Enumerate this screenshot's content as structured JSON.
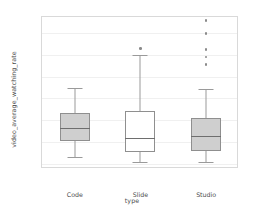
{
  "chart_data": {
    "type": "box",
    "title": "",
    "xlabel": "type",
    "ylabel": "video_average_watching_rate",
    "categories": [
      "Code",
      "Slide",
      "Studio"
    ],
    "ylim": [
      -0.025,
      0.675
    ],
    "yticks": [
      0.0,
      0.1,
      0.2,
      0.3,
      0.4,
      0.5,
      0.6
    ],
    "ytick_labels": [
      "0.0",
      "0.1",
      "0.2",
      "0.3",
      "0.4",
      "0.5",
      "0.6"
    ],
    "grid": "horizontal",
    "legend": "none",
    "boxes": [
      {
        "label": "Code",
        "fill": "#cfcfcf",
        "whisker_low": 0.03,
        "q1": 0.105,
        "median": 0.165,
        "q3": 0.235,
        "whisker_high": 0.35,
        "outliers": []
      },
      {
        "label": "Slide",
        "fill": "#ffffff",
        "whisker_low": 0.005,
        "q1": 0.055,
        "median": 0.12,
        "q3": 0.24,
        "whisker_high": 0.5,
        "outliers": [
          0.53
        ]
      },
      {
        "label": "Studio",
        "fill": "#cfcfcf",
        "whisker_low": 0.005,
        "q1": 0.06,
        "median": 0.125,
        "q3": 0.21,
        "whisker_high": 0.345,
        "outliers": [
          0.455,
          0.49,
          0.525,
          0.6,
          0.66
        ]
      }
    ]
  },
  "colors": {
    "box_edge": "#8f8f8f",
    "median": "#6e6e6e",
    "whisker": "#9a9a9a",
    "grid": "#f0f0f0",
    "frame": "#d9d9d9",
    "text": "#4d4d4d",
    "background": "#ffffff"
  }
}
